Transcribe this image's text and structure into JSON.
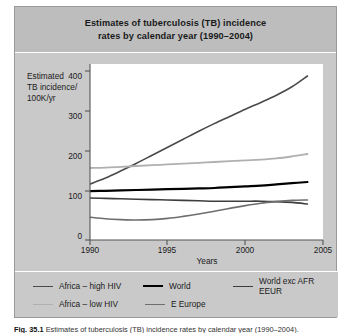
{
  "figure": {
    "title_line1": "Estimates of tuberculosis (TB) incidence",
    "title_line2": "rates by calendar year (1990–2004)",
    "caption_label": "Fig. 35.1",
    "caption_text": "Estimates of tuberculosis (TB) incidence rates by calendar year (1990–2004)."
  },
  "axes": {
    "ylabel_line1": "Estimated",
    "ylabel_line2": "TB incidence/",
    "ylabel_line3": "100K/yr",
    "xlabel": "Years",
    "yticks": [
      "0",
      "100",
      "200",
      "300",
      "400"
    ],
    "xticks": [
      "1990",
      "1995",
      "2000",
      "2005"
    ]
  },
  "legend": {
    "items": [
      {
        "label": "Africa – high HIV",
        "color": "#4a4a4a",
        "width": 1.6
      },
      {
        "label": "World",
        "color": "#000000",
        "width": 2.2
      },
      {
        "label": "World exc AFR EEUR",
        "color": "#3d3d3d",
        "width": 1.6
      },
      {
        "label": "Africa – low HIV",
        "color": "#b0b0b0",
        "width": 1.8
      },
      {
        "label": "E Europe",
        "color": "#6e6e6e",
        "width": 1.6
      }
    ]
  },
  "chart_data": {
    "type": "line",
    "title": "Estimates of tuberculosis (TB) incidence rates by calendar year (1990–2004)",
    "xlabel": "Years",
    "ylabel": "Estimated TB incidence/100K/yr",
    "xlim": [
      1990,
      2005
    ],
    "ylim": [
      0,
      440
    ],
    "xticks": [
      1990,
      1995,
      2000,
      2005
    ],
    "yticks": [
      0,
      100,
      200,
      300,
      400
    ],
    "grid": false,
    "legend_position": "below-plot",
    "x": [
      1990,
      1991,
      1992,
      1993,
      1994,
      1995,
      1996,
      1997,
      1998,
      1999,
      2000,
      2001,
      2002,
      2003,
      2004
    ],
    "series": [
      {
        "name": "Africa – high HIV",
        "color": "#4a4a4a",
        "values": [
          140,
          155,
          173,
          192,
          212,
          232,
          252,
          272,
          291,
          309,
          327,
          344,
          362,
          383,
          410
        ]
      },
      {
        "name": "Africa – low HIV",
        "color": "#b0b0b0",
        "values": [
          180,
          181,
          183,
          185,
          187,
          189,
          191,
          193,
          195,
          197,
          199,
          201,
          204,
          209,
          215
        ]
      },
      {
        "name": "World",
        "color": "#000000",
        "values": [
          122,
          123,
          124,
          125,
          126,
          127,
          128,
          129,
          130,
          132,
          134,
          136,
          139,
          142,
          145
        ]
      },
      {
        "name": "World exc AFR EEUR",
        "color": "#3d3d3d",
        "values": [
          105,
          104,
          103,
          102,
          101,
          100,
          99,
          98,
          97,
          97,
          97,
          97,
          96,
          94,
          90
        ]
      },
      {
        "name": "E Europe",
        "color": "#6e6e6e",
        "values": [
          57,
          53,
          51,
          50,
          51,
          54,
          59,
          65,
          72,
          79,
          86,
          92,
          96,
          99,
          100
        ]
      }
    ]
  }
}
